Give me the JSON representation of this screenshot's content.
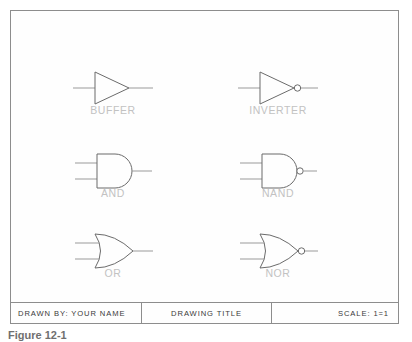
{
  "drawing": {
    "sheet_border_color": "#8d8d8d",
    "symbol_stroke_color": "#6b6b6b",
    "label_color": "#c2c2c2",
    "background_color": "#fefefe",
    "gates": [
      {
        "id": "buffer",
        "label": "BUFFER",
        "shape": "triangle",
        "inputs": 1,
        "inverting": false
      },
      {
        "id": "inverter",
        "label": "INVERTER",
        "shape": "triangle",
        "inputs": 1,
        "inverting": true
      },
      {
        "id": "and",
        "label": "AND",
        "shape": "and",
        "inputs": 2,
        "inverting": false
      },
      {
        "id": "nand",
        "label": "NAND",
        "shape": "and",
        "inputs": 2,
        "inverting": true
      },
      {
        "id": "or",
        "label": "OR",
        "shape": "or",
        "inputs": 2,
        "inverting": false
      },
      {
        "id": "nor",
        "label": "NOR",
        "shape": "or",
        "inputs": 2,
        "inverting": true
      }
    ]
  },
  "title_block": {
    "drawn_by": "DRAWN BY:  YOUR  NAME",
    "drawing_title": "DRAWING  TITLE",
    "scale": "SCALE:  1=1"
  },
  "caption": {
    "text": "Figure 12-1"
  }
}
